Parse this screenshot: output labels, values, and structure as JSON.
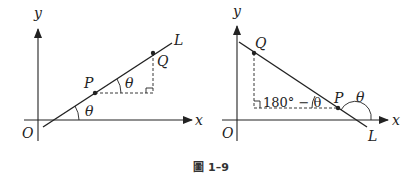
{
  "figure": {
    "caption_prefix_glyph": "圖",
    "caption_number": "1–9"
  },
  "left_diagram": {
    "axis_x_label": "x",
    "axis_y_label": "y",
    "origin_label": "O",
    "line_label": "L",
    "point_p_label": "P",
    "point_q_label": "Q",
    "angle_at_p_label": "θ",
    "angle_at_axis_label": "θ"
  },
  "right_diagram": {
    "axis_x_label": "x",
    "axis_y_label": "y",
    "origin_label": "O",
    "line_label": "L",
    "point_p_label": "P",
    "point_q_label": "Q",
    "angle_in_triangle_label": "180° − θ",
    "angle_at_axis_label": "θ"
  },
  "colors": {
    "ink": "#222222",
    "background": "#ffffff"
  }
}
